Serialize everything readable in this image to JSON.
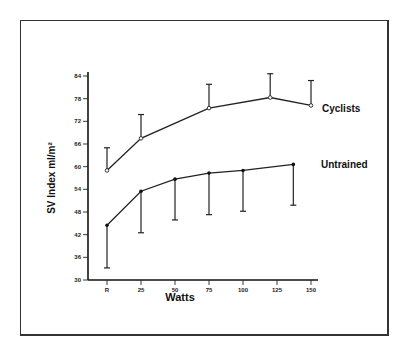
{
  "chart_data": {
    "type": "line",
    "title": "",
    "xlabel": "Watts",
    "ylabel": "SV Index ml/m²",
    "ylim": [
      30,
      84
    ],
    "yticks": [
      30,
      36,
      42,
      48,
      54,
      60,
      66,
      72,
      78,
      84
    ],
    "xticks": [
      {
        "label": "R",
        "x": 0
      },
      {
        "label": "25",
        "x": 25
      },
      {
        "label": "50",
        "x": 50
      },
      {
        "label": "75",
        "x": 75
      },
      {
        "label": "100",
        "x": 100
      },
      {
        "label": "125",
        "x": 125
      },
      {
        "label": "150",
        "x": 150
      }
    ],
    "xlim": [
      -12,
      160
    ],
    "grid": false,
    "legend_position": "inline-right",
    "series": [
      {
        "name": "Cyclists",
        "marker": "open-circle",
        "error_direction": "up",
        "x": [
          0,
          25,
          75,
          120,
          150
        ],
        "values": [
          59,
          67.5,
          75.5,
          78.3,
          76.2
        ],
        "error": [
          6,
          6.3,
          6.3,
          6.3,
          6.6
        ]
      },
      {
        "name": "Untrained",
        "marker": "filled-circle",
        "error_direction": "down",
        "x": [
          0,
          25,
          50,
          75,
          100,
          137
        ],
        "values": [
          44.5,
          53.5,
          56.7,
          58.3,
          59,
          60.6
        ],
        "error": [
          11.3,
          11,
          10.8,
          11,
          10.8,
          10.8
        ]
      }
    ]
  },
  "labels": {
    "xlabel": "Watts",
    "ylabel": "SV Index ml/m²",
    "cyclists": "Cyclists",
    "untrained": "Untrained"
  }
}
